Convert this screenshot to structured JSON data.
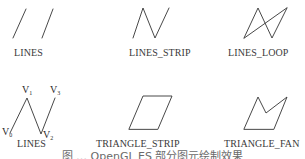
{
  "figure": {
    "panels": [
      {
        "id": "lines",
        "label": "LINES",
        "type": "separate-segments"
      },
      {
        "id": "lines_strip",
        "label": "LINES_STRIP",
        "type": "polyline"
      },
      {
        "id": "lines_loop",
        "label": "LINES_LOOP",
        "type": "closed-polyline"
      },
      {
        "id": "lines_vertices",
        "label": "LINES",
        "type": "polyline-with-vertex-labels",
        "vertices": [
          {
            "name": "V",
            "sub": "0"
          },
          {
            "name": "V",
            "sub": "1"
          },
          {
            "name": "V",
            "sub": "2"
          },
          {
            "name": "V",
            "sub": "3"
          }
        ]
      },
      {
        "id": "triangle_strip",
        "label": "TRIANGLE_STRIP",
        "type": "parallelogram"
      },
      {
        "id": "triangle_fan",
        "label": "TRIANGLE_FAN",
        "type": "fan-polygon"
      }
    ],
    "caption": "图 … OpenGL ES 部分图元绘制效果"
  },
  "colors": {
    "stroke": "#333333",
    "text": "#3a3a3a",
    "background": "#ffffff"
  }
}
